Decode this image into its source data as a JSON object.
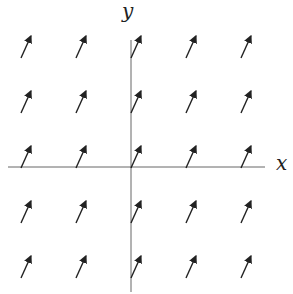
{
  "diagram": {
    "type": "vector-field",
    "axes": {
      "x_label": "x",
      "y_label": "y"
    },
    "grid": {
      "columns": [
        -2,
        -1,
        0,
        1,
        2
      ],
      "rows": [
        2,
        1,
        0,
        -1,
        -2
      ]
    },
    "vector": {
      "dx": 0.18,
      "dy": 0.4
    },
    "colors": {
      "axis": "#666666",
      "arrow": "#222222"
    }
  }
}
